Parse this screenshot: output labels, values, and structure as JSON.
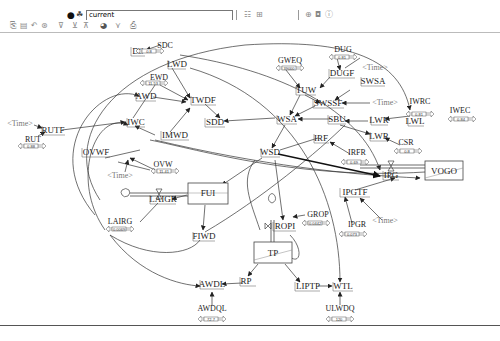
{
  "toolbar": {
    "run_name": "current",
    "row1_icons": [
      "record-icon",
      "run-simulation-icon",
      "sketch-tool-icon",
      "grid-icon",
      "causal-tree-icon",
      "uses-tree-icon",
      "info-icon"
    ],
    "row2_icons": [
      "open-icon",
      "save-icon",
      "undo-icon",
      "redo-icon",
      "filter-icon",
      "variable-icon",
      "level-icon",
      "color-icon",
      "text-icon",
      "document-icon"
    ]
  },
  "diagram": {
    "variables": [
      {
        "id": "DS",
        "label": "DS",
        "x": 138,
        "y": 51
      },
      {
        "id": "SDC",
        "label": "SDC",
        "x": 165,
        "y": 46
      },
      {
        "id": "LWD",
        "label": "LWD",
        "x": 172,
        "y": 64
      },
      {
        "id": "EWD",
        "label": "EWD",
        "x": 154,
        "y": 78
      },
      {
        "id": "AWD",
        "label": "AWD",
        "x": 141,
        "y": 96
      },
      {
        "id": "TWDF",
        "label": "TWDF",
        "x": 198,
        "y": 100
      },
      {
        "id": "IWC",
        "label": "IWC",
        "x": 129,
        "y": 122
      },
      {
        "id": "IMWD",
        "label": "IMWD",
        "x": 166,
        "y": 135
      },
      {
        "id": "SDD",
        "label": "SDD",
        "x": 212,
        "y": 122
      },
      {
        "id": "RUTF",
        "label": "RUTF",
        "x": 41,
        "y": 130
      },
      {
        "id": "RUT",
        "label": "RUT",
        "x": 34,
        "y": 139
      },
      {
        "id": "OVWF",
        "label": "OVWF",
        "x": 93,
        "y": 152
      },
      {
        "id": "OVW",
        "label": "OVW",
        "x": 150,
        "y": 165
      },
      {
        "id": "GWEQ",
        "label": "GWEQ",
        "x": 286,
        "y": 61
      },
      {
        "id": "DUG",
        "label": "DUG",
        "x": 344,
        "y": 50
      },
      {
        "id": "DUGF",
        "label": "DUGF",
        "x": 341,
        "y": 73
      },
      {
        "id": "TUW",
        "label": "TUW",
        "x": 305,
        "y": 90
      },
      {
        "id": "SWSA",
        "label": "SWSA",
        "x": 363,
        "y": 81
      },
      {
        "id": "SWSSF",
        "label": "SWSSF",
        "x": 324,
        "y": 103
      },
      {
        "id": "WSA",
        "label": "WSA",
        "x": 283,
        "y": 119
      },
      {
        "id": "SBU",
        "label": "SBU",
        "x": 338,
        "y": 119
      },
      {
        "id": "LWR_top",
        "label": "LWR",
        "x": 375,
        "y": 119
      },
      {
        "id": "LWR_bottom",
        "label": "LWR",
        "x": 374,
        "y": 136
      },
      {
        "id": "IWRC",
        "label": "IWRC",
        "x": 420,
        "y": 102
      },
      {
        "id": "LWL",
        "label": "LWL",
        "x": 417,
        "y": 122
      },
      {
        "id": "IWEC",
        "label": "IWEC",
        "x": 459,
        "y": 111
      },
      {
        "id": "CSR",
        "label": "CSR",
        "x": 404,
        "y": 143
      },
      {
        "id": "IRF",
        "label": "IRF",
        "x": 321,
        "y": 138
      },
      {
        "id": "IRFR",
        "label": "IRFR",
        "x": 357,
        "y": 153
      },
      {
        "id": "WSD",
        "label": "WSD",
        "x": 268,
        "y": 152
      },
      {
        "id": "IPG",
        "label": "IPG",
        "x": 390,
        "y": 175
      },
      {
        "id": "IPGTF",
        "label": "IPGTF",
        "x": 355,
        "y": 192
      },
      {
        "id": "IPGR",
        "label": "IPGR",
        "x": 358,
        "y": 225
      },
      {
        "id": "GROP",
        "label": "GROP",
        "x": 318,
        "y": 215
      },
      {
        "id": "ROPI",
        "label": "ROPI",
        "x": 283,
        "y": 226
      },
      {
        "id": "LAIGR",
        "label": "LAIGR",
        "x": 163,
        "y": 199
      },
      {
        "id": "LAIRG",
        "label": "LAIRG",
        "x": 120,
        "y": 222
      },
      {
        "id": "FIWD",
        "label": "FIWD",
        "x": 204,
        "y": 236
      },
      {
        "id": "RP",
        "label": "RP",
        "x": 246,
        "y": 281
      },
      {
        "id": "AWDL",
        "label": "AWDL",
        "x": 211,
        "y": 284
      },
      {
        "id": "AWDQL",
        "label": "AWDQL",
        "x": 212,
        "y": 309
      },
      {
        "id": "LIPTP",
        "label": "LIPTP",
        "x": 306,
        "y": 286
      },
      {
        "id": "WTL",
        "label": "WTL",
        "x": 338,
        "y": 286
      },
      {
        "id": "ULWDQ",
        "label": "ULWDQ",
        "x": 340,
        "y": 309
      }
    ],
    "time_labels": [
      {
        "label": "<Time>",
        "x": 375,
        "y": 68
      },
      {
        "label": "<Time>",
        "x": 385,
        "y": 103
      },
      {
        "label": "<Time>",
        "x": 20,
        "y": 124
      },
      {
        "label": "<Time>",
        "x": 122,
        "y": 176
      },
      {
        "label": "<Time>",
        "x": 385,
        "y": 221
      }
    ],
    "stocks": [
      {
        "id": "FUI",
        "label": "FUI",
        "x": 188,
        "y": 183,
        "w": 40,
        "h": 21
      },
      {
        "id": "VOGO",
        "label": "VOGO",
        "x": 425,
        "y": 161,
        "w": 38,
        "h": 19
      },
      {
        "id": "TP",
        "label": "TP",
        "x": 254,
        "y": 242,
        "w": 38,
        "h": 21
      }
    ],
    "sliders": [
      {
        "id": "SDC_slider",
        "value": "0.8",
        "x": 150,
        "y": 51
      },
      {
        "id": "EWD_slider",
        "value": "11.53",
        "x": 154,
        "y": 83
      },
      {
        "id": "RUT_slider",
        "value": "0.88",
        "x": 23,
        "y": 146
      },
      {
        "id": "OVW_slider",
        "value": "11.41",
        "x": 150,
        "y": 171
      },
      {
        "id": "LAIRG_slider",
        "value": "0.0069",
        "x": 115,
        "y": 227
      },
      {
        "id": "GWEQ_slider",
        "value": "39000",
        "x": 286,
        "y": 66
      },
      {
        "id": "DUG_slider",
        "value": "0.81",
        "x": 340,
        "y": 55
      },
      {
        "id": "IWRC_slider",
        "value": "0.81",
        "x": 420,
        "y": 108
      },
      {
        "id": "IWEC_slider",
        "value": "0.84",
        "x": 456,
        "y": 116
      },
      {
        "id": "CSR_slider",
        "value": "0.8",
        "x": 406,
        "y": 149
      },
      {
        "id": "IRFR_slider",
        "value": "0.69",
        "x": 357,
        "y": 161
      },
      {
        "id": "GROP_slider",
        "value": "0.0442",
        "x": 318,
        "y": 223
      },
      {
        "id": "IPGR_slider",
        "value": "0.073",
        "x": 350,
        "y": 234
      },
      {
        "id": "AWDQL_slider",
        "value": "72.7",
        "x": 212,
        "y": 318
      },
      {
        "id": "ULWDQ_slider",
        "value": "120",
        "x": 340,
        "y": 318
      }
    ]
  }
}
